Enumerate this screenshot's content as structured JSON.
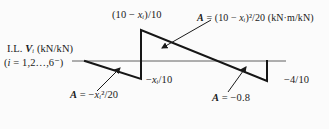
{
  "colors": {
    "background": "#fbfbfb",
    "ink": "#1a1a1a",
    "baseline": "#606060"
  },
  "il_caption": {
    "line1": [
      {
        "t": "I.L. "
      },
      {
        "t": "V",
        "i": true,
        "b": true
      },
      {
        "t": "ᵢ",
        "i": true
      },
      {
        "t": " (kN/kN)"
      }
    ],
    "line2": [
      {
        "t": "("
      },
      {
        "t": "i",
        "i": true
      },
      {
        "t": " = 1,2…,6⁻)"
      }
    ]
  },
  "annotations": {
    "top_ordinate": [
      {
        "t": "(10 − "
      },
      {
        "t": "x",
        "i": true
      },
      {
        "t": "ᵢ",
        "i": true
      },
      {
        "t": ")/10"
      }
    ],
    "area_right": [
      {
        "t": "A",
        "i": true,
        "b": true
      },
      {
        "t": " = (10 − "
      },
      {
        "t": "x",
        "i": true
      },
      {
        "t": "ᵢ",
        "i": true
      },
      {
        "t": ")²/20 (kN·m/kN)"
      }
    ],
    "mid_ordinate": [
      {
        "t": "−"
      },
      {
        "t": "x",
        "i": true
      },
      {
        "t": "ᵢ",
        "i": true
      },
      {
        "t": "/10"
      }
    ],
    "area_left": [
      {
        "t": "A",
        "i": true,
        "b": true
      },
      {
        "t": " = −"
      },
      {
        "t": "x",
        "i": true
      },
      {
        "t": "ᵢ",
        "i": true
      },
      {
        "t": "²/20"
      }
    ],
    "area_mid": [
      {
        "t": "A",
        "i": true,
        "b": true
      },
      {
        "t": " = −0.8"
      }
    ],
    "right_ordinate": [
      {
        "t": "−4/10"
      }
    ]
  }
}
